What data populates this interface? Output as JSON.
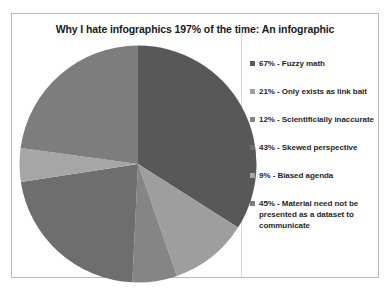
{
  "chart_data": {
    "type": "pie",
    "title": "Why I hate infographics 197% of the time: An infographic",
    "categories": [
      "Fuzzy math",
      "Only exists as link bait",
      "Scientificially inaccurate",
      "Skewed perspective",
      "Biased agenda",
      "Material need not be presented as a dataset to communicate"
    ],
    "values": [
      67,
      21,
      12,
      43,
      9,
      45
    ],
    "total": 197,
    "legend_entries": [
      "67% - Fuzzy math",
      "21% - Only exists as link bait",
      "12%  - Scientificially inaccurate",
      "43% - Skewed perspective",
      "9% - Biased agenda",
      "45% - Material need not be presented as a dataset to communicate"
    ],
    "slice_colors": [
      "#585858",
      "#9e9e9e",
      "#858585",
      "#6e6e6e",
      "#a6a6a6",
      "#7d7d7d"
    ],
    "legend_position": "right",
    "grid": false,
    "xlabel": "",
    "ylabel": ""
  },
  "chart": {
    "title": "Why I hate infographics 197% of the time: An infographic"
  },
  "colors": {
    "border": "#b9b9b9",
    "divider": "#d8d8d8",
    "background": "#ffffff",
    "text": "#1f1f1f"
  }
}
